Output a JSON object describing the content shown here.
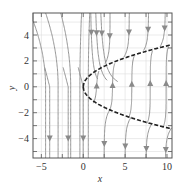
{
  "figure": {
    "type": "phase-portrait",
    "xlabel": "x",
    "ylabel": "y",
    "xlim": [
      -6,
      10.6
    ],
    "ylim": [
      -5.5,
      5.7
    ],
    "x_ticks": [
      {
        "value": -5,
        "label": "−5"
      },
      {
        "value": 0,
        "label": "0"
      },
      {
        "value": 5,
        "label": "5"
      },
      {
        "value": 10,
        "label": "10"
      }
    ],
    "y_ticks": [
      {
        "value": 4,
        "label": "4"
      },
      {
        "value": 2,
        "label": "2"
      },
      {
        "value": 0,
        "label": "0"
      },
      {
        "value": -2,
        "label": "−2"
      },
      {
        "value": -4,
        "label": "−4"
      }
    ],
    "grid": true,
    "colors": {
      "frame": "#555555",
      "grid": "#dddddd",
      "trajectory": "#8a8a8a",
      "dashed_curve": "#222222"
    },
    "dashed_curves": [
      {
        "name": "upper-branch",
        "equation": "y = sqrt(x)"
      },
      {
        "name": "lower-branch",
        "equation": "y = -sqrt(x)"
      }
    ],
    "flow_direction": {
      "outside_parabola": "down",
      "inside_parabola": "up"
    }
  }
}
